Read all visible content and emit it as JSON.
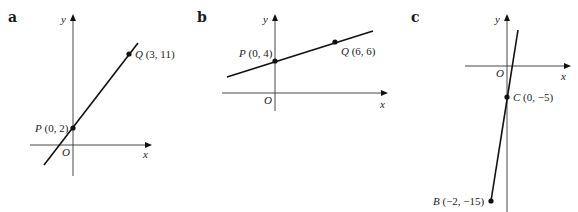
{
  "panels": [
    {
      "label": "a",
      "axes": {
        "x": "x",
        "y": "y",
        "origin": "O"
      },
      "points": [
        {
          "name": "P",
          "coords": "(0, 2)",
          "x": 0,
          "y": 2
        },
        {
          "name": "Q",
          "coords": "(3, 11)",
          "x": 3,
          "y": 11
        }
      ]
    },
    {
      "label": "b",
      "axes": {
        "x": "x",
        "y": "y",
        "origin": "O"
      },
      "points": [
        {
          "name": "P",
          "coords": "(0, 4)",
          "x": 0,
          "y": 4
        },
        {
          "name": "Q",
          "coords": "(6, 6)",
          "x": 6,
          "y": 6
        }
      ]
    },
    {
      "label": "c",
      "axes": {
        "x": "x",
        "y": "y",
        "origin": "O"
      },
      "points": [
        {
          "name": "C",
          "coords": "(0, −5)",
          "x": 0,
          "y": -5
        },
        {
          "name": "B",
          "coords": "(−2, −15)",
          "x": -2,
          "y": -15
        }
      ]
    }
  ]
}
